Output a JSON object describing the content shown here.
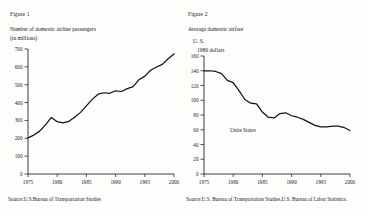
{
  "figures": [
    {
      "figure_label": "Figure 1",
      "caption_line1": "Number of domestic airline passengers",
      "caption_line2": "(in millions)",
      "source": "Source:U.S.Bureau of Transportation Studies",
      "chart_data": {
        "type": "line",
        "title": "Number of domestic airline passengers (in millions)",
        "xlabel": "",
        "ylabel": "",
        "xlim": [
          1975,
          2000
        ],
        "ylim": [
          0,
          700
        ],
        "xticks": [
          "1975",
          "1980",
          "1985",
          "1990",
          "1995",
          "2000"
        ],
        "yticks": [
          "0",
          "100",
          "200",
          "300",
          "400",
          "500",
          "600",
          "700"
        ],
        "grid": false,
        "legend": "none",
        "series": [
          {
            "name": "Domestic airline passengers",
            "x": [
              1975,
              1976,
              1977,
              1978,
              1979,
              1980,
              1981,
              1982,
              1983,
              1984,
              1985,
              1986,
              1987,
              1988,
              1989,
              1990,
              1991,
              1992,
              1993,
              1994,
              1995,
              1996,
              1997,
              1998,
              1999,
              2000
            ],
            "values": [
              202,
              218,
              240,
              275,
              317,
              293,
              286,
              295,
              318,
              345,
              382,
              418,
              447,
              455,
              452,
              466,
              462,
              478,
              489,
              528,
              548,
              581,
              599,
              614,
              645,
              672
            ]
          }
        ]
      }
    },
    {
      "figure_label": "Figure 2",
      "caption_line1": "Average domestic airfare",
      "caption_line2": "U. S.",
      "caption_line3": "1980 dollars",
      "series_label": "Unite States",
      "source": "Source:U.S. Bureau of Transportation Studies,U.S. Bureau of Labor Statistics.",
      "chart_data": {
        "type": "line",
        "title": "Average domestic airfare, U.S. 1980 dollars",
        "xlabel": "",
        "ylabel": "",
        "xlim": [
          1975,
          2000
        ],
        "ylim": [
          0,
          160
        ],
        "xticks": [
          "1975",
          "1980",
          "1985",
          "1990",
          "1995",
          "2000"
        ],
        "yticks": [
          "0",
          "20",
          "40",
          "60",
          "80",
          "100",
          "120",
          "140",
          "160"
        ],
        "grid": false,
        "legend": "inline",
        "series": [
          {
            "name": "Unite States",
            "x": [
              1975,
              1976,
              1977,
              1978,
              1979,
              1980,
              1981,
              1982,
              1983,
              1984,
              1985,
              1986,
              1987,
              1988,
              1989,
              1990,
              1991,
              1992,
              1993,
              1994,
              1995,
              1996,
              1997,
              1998,
              1999,
              2000
            ],
            "values": [
              140,
              140,
              139,
              136,
              127,
              124,
              113,
              101,
              96,
              95,
              84,
              77,
              76,
              82,
              83,
              79,
              77,
              74,
              70,
              66,
              64,
              64,
              65,
              65,
              63,
              59
            ]
          }
        ]
      }
    }
  ],
  "colors": {
    "ink": "#161616",
    "axis": "#2a2a2a",
    "paper": "#fdfdfc"
  }
}
